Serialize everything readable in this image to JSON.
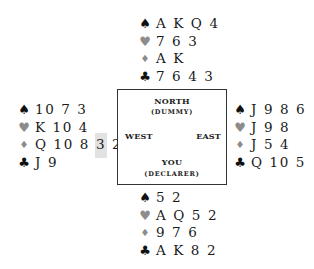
{
  "colors": {
    "black_suit": "#111111",
    "red_suit_gray": "#8c8c8c",
    "highlight": "#e2e2e2",
    "table_border": "#333333"
  },
  "suit_icons": {
    "spades": "♠",
    "hearts": "♥",
    "diamonds": "♦",
    "clubs": "♣"
  },
  "table": {
    "north_label": "NORTH",
    "north_sub": "(DUMMY)",
    "west_label": "WEST",
    "east_label": "EAST",
    "south_label": "YOU",
    "south_sub": "(DECLARER)"
  },
  "hands": {
    "north": {
      "spades": "A K Q 4",
      "hearts": "7 6 3",
      "diamonds": "A K",
      "clubs": "7 6 4 3"
    },
    "west": {
      "spades": "10 7 3",
      "hearts": "K 10 4",
      "diamonds_before": "Q 10 8 ",
      "diamonds_highlight": "3",
      "diamonds_after": " 2",
      "clubs": "J 9"
    },
    "east": {
      "spades": "J 9 8 6",
      "hearts": "J 9 8",
      "diamonds": "J 5 4",
      "clubs": "Q 10 5"
    },
    "south": {
      "spades": "5 2",
      "hearts": "A Q 5 2",
      "diamonds": "9 7 6",
      "clubs": "A K 8 2"
    }
  }
}
